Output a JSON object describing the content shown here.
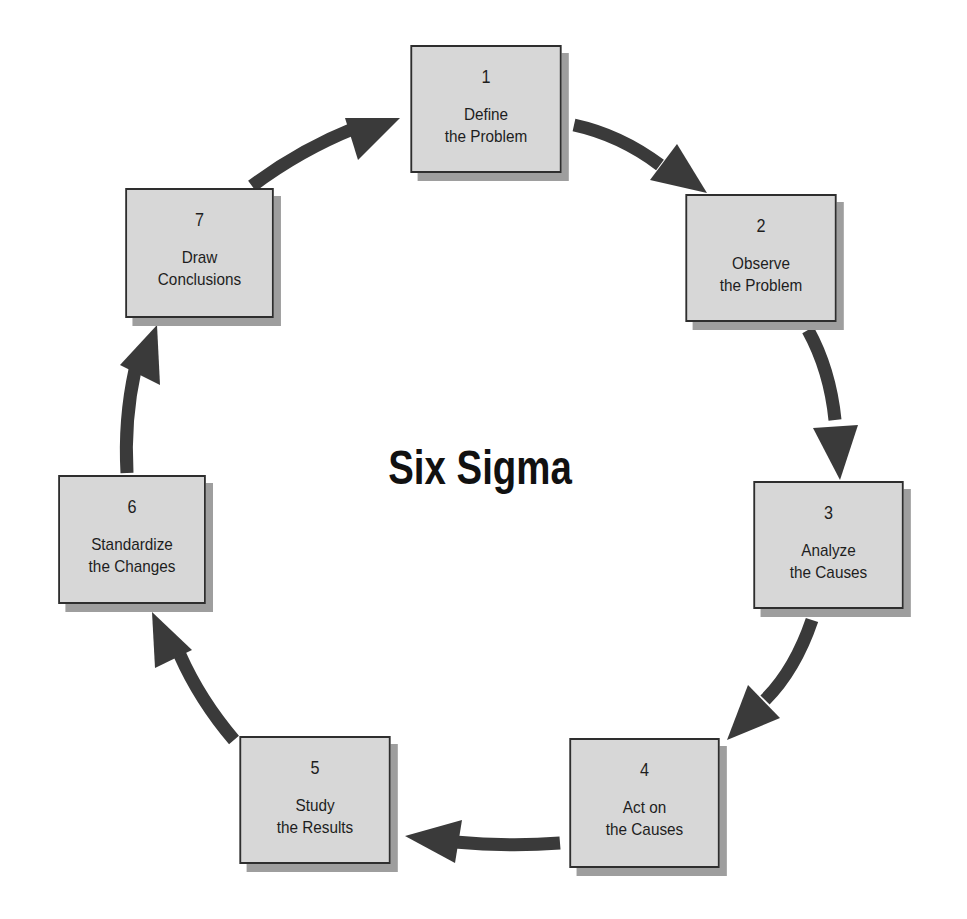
{
  "title": "Six Sigma",
  "colors": {
    "box_fill": "#d7d7d7",
    "box_border": "#2e2e2e",
    "box_shadow": "#9e9e9e",
    "arrow": "#3a3a3a",
    "background": "#ffffff"
  },
  "steps": [
    {
      "number": "1",
      "line1": "Define",
      "line2": "the Problem"
    },
    {
      "number": "2",
      "line1": "Observe",
      "line2": "the Problem"
    },
    {
      "number": "3",
      "line1": "Analyze",
      "line2": "the Causes"
    },
    {
      "number": "4",
      "line1": "Act on",
      "line2": "the Causes"
    },
    {
      "number": "5",
      "line1": "Study",
      "line2": "the Results"
    },
    {
      "number": "6",
      "line1": "Standardize",
      "line2": "the Changes"
    },
    {
      "number": "7",
      "line1": "Draw",
      "line2": "Conclusions"
    }
  ],
  "flow": [
    {
      "from": "1",
      "to": "2"
    },
    {
      "from": "2",
      "to": "3"
    },
    {
      "from": "3",
      "to": "4"
    },
    {
      "from": "4",
      "to": "5"
    },
    {
      "from": "5",
      "to": "6"
    },
    {
      "from": "6",
      "to": "7"
    },
    {
      "from": "7",
      "to": "1"
    }
  ]
}
